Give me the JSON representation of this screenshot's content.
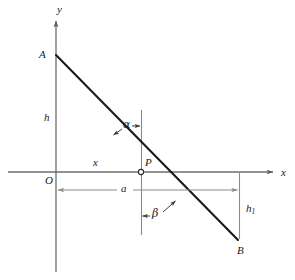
{
  "figure": {
    "type": "geometry-diagram",
    "colors": {
      "axis": "#6e6e6e",
      "segment": "#1a1a1a",
      "dimension": "#8a8a8a",
      "label": "#1a1a1a",
      "background": "#ffffff"
    }
  },
  "axes": {
    "y_label": "y",
    "x_label": "x",
    "origin_label": "O"
  },
  "points": [
    {
      "name": "A",
      "label": "A",
      "x": 56,
      "y": 55
    },
    {
      "name": "P",
      "label": "P",
      "x": 141,
      "y": 172
    },
    {
      "name": "B",
      "label": "B",
      "x": 238,
      "y": 240
    },
    {
      "name": "O",
      "label": "O",
      "x": 56,
      "y": 172
    }
  ],
  "dimensions": [
    {
      "name": "h",
      "label": "h",
      "kind": "height-left",
      "from": "O",
      "to": "A"
    },
    {
      "name": "x",
      "label": "x",
      "kind": "run-on-axis",
      "from": "O",
      "to": "P"
    },
    {
      "name": "a",
      "label": "a",
      "kind": "span-below",
      "from": "O",
      "to": "foot-of-B"
    },
    {
      "name": "h1",
      "label": "h",
      "sub": "1",
      "kind": "height-right",
      "from": "foot-of-B",
      "to": "B"
    }
  ],
  "angles": [
    {
      "name": "alpha",
      "label": "α",
      "at": "P",
      "between": [
        "vertical-up",
        "PA"
      ]
    },
    {
      "name": "beta",
      "label": "β",
      "at": "P",
      "between": [
        "vertical-down",
        "PB"
      ]
    }
  ],
  "geometry": {
    "y_axis": {
      "x": 56,
      "top": 18,
      "bottom": 272
    },
    "x_axis": {
      "y": 172,
      "left": 8,
      "right": 276
    },
    "vertical_through_P": {
      "x": 141.5,
      "top": 110,
      "bottom": 235
    },
    "segment_AB": {
      "x1": 56,
      "y1": 55,
      "x2": 238,
      "y2": 240
    },
    "h1_line": {
      "x": 239.5,
      "top": 172,
      "bottom": 239
    },
    "a_dimension_line": {
      "y": 190,
      "left": 56,
      "right": 239.5
    }
  }
}
